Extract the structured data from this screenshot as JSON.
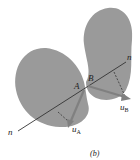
{
  "diagram": {
    "type": "physics-contact-diagram",
    "bodies": [
      "body-A",
      "body-B"
    ],
    "colors": {
      "body_fill": "#9a9a9a",
      "line": "#333333",
      "arrow": "#808080",
      "background": "#ffffff"
    },
    "labels": {
      "point_a": "A",
      "point_b": "B",
      "normal_left": "n",
      "normal_right": "n",
      "velocity_a": "u",
      "velocity_a_sub": "A",
      "velocity_b": "u",
      "velocity_b_sub": "B",
      "caption": "(b)"
    }
  }
}
